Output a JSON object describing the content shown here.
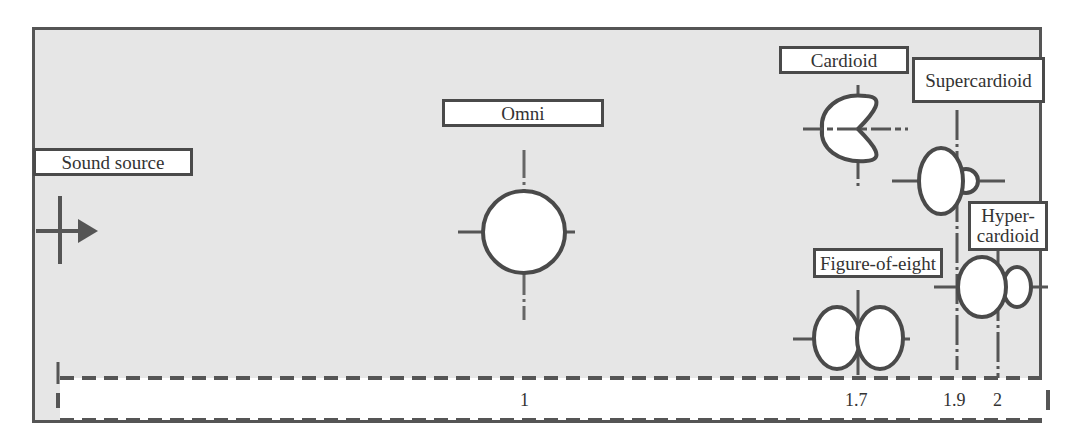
{
  "diagram": {
    "colors": {
      "background": "#e6e6e6",
      "stroke": "#4a4a4a",
      "label_fill": "#ffffff",
      "text": "#333333"
    },
    "labels": {
      "sound_source": "Sound source",
      "omni": "Omni",
      "cardioid": "Cardioid",
      "supercardioid": "Supercardioid",
      "hypercardioid_line1": "Hyper-",
      "hypercardioid_line2": "cardioid",
      "figure_of_eight": "Figure-of-eight"
    },
    "icons": {
      "sound_source": "crosshair-arrow-right-icon",
      "omni": "circle-pattern-icon",
      "cardioid": "heart-pattern-icon",
      "supercardioid": "supercardioid-pattern-icon",
      "hypercardioid": "hypercardioid-pattern-icon",
      "figure_of_eight": "figure-eight-pattern-icon"
    },
    "scale": {
      "ticks": [
        {
          "pattern": "Omni",
          "value": "1"
        },
        {
          "pattern": "Figure-of-eight",
          "value": "1.7"
        },
        {
          "pattern": "Supercardioid",
          "value": "1.9"
        },
        {
          "pattern": "Hypercardioid",
          "value": "2"
        }
      ]
    }
  }
}
